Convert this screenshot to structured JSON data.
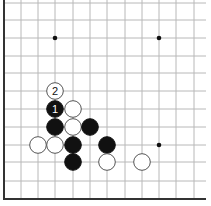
{
  "diagram": {
    "type": "go-board-corner",
    "grid": {
      "x_lines": [
        4,
        21,
        38,
        55,
        73,
        90,
        107,
        125,
        142,
        159,
        176,
        194
      ],
      "y_lines": [
        3,
        20,
        38,
        56,
        73,
        91,
        109,
        127,
        145,
        162,
        181,
        199
      ],
      "edge_left_x": 4,
      "edge_bottom_y": 199,
      "line_color": "#b8b8b8",
      "edge_color": "#333333"
    },
    "star_points": [
      {
        "x": 55,
        "y": 38
      },
      {
        "x": 159,
        "y": 38
      },
      {
        "x": 159,
        "y": 145
      }
    ],
    "stones": [
      {
        "color": "white",
        "x": 55,
        "y": 91,
        "label": "2"
      },
      {
        "color": "black",
        "x": 55,
        "y": 109,
        "label": "1"
      },
      {
        "color": "white",
        "x": 73,
        "y": 109,
        "label": ""
      },
      {
        "color": "black",
        "x": 55,
        "y": 127,
        "label": ""
      },
      {
        "color": "white",
        "x": 73,
        "y": 127,
        "label": ""
      },
      {
        "color": "black",
        "x": 90,
        "y": 127,
        "label": ""
      },
      {
        "color": "white",
        "x": 38,
        "y": 145,
        "label": ""
      },
      {
        "color": "white",
        "x": 55,
        "y": 145,
        "label": ""
      },
      {
        "color": "black",
        "x": 73,
        "y": 145,
        "label": ""
      },
      {
        "color": "black",
        "x": 107,
        "y": 145,
        "label": ""
      },
      {
        "color": "black",
        "x": 73,
        "y": 162,
        "label": ""
      },
      {
        "color": "white",
        "x": 107,
        "y": 162,
        "label": ""
      },
      {
        "color": "white",
        "x": 142,
        "y": 162,
        "label": ""
      }
    ],
    "move_labels": {
      "first": "1",
      "second": "2"
    }
  }
}
